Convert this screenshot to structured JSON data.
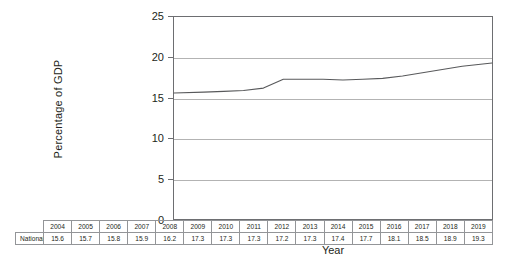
{
  "chart_data": {
    "type": "line",
    "title": "",
    "xlabel": "Year",
    "ylabel": "Percentage of GDP",
    "ylim": [
      0,
      25
    ],
    "yticks": [
      0,
      5,
      10,
      15,
      20,
      25
    ],
    "grid": "horizontal",
    "legend": "none",
    "x": [
      2004,
      2005,
      2006,
      2007,
      2008,
      2009,
      2010,
      2011,
      2012,
      2013,
      2014,
      2015,
      2016,
      2017,
      2018,
      2019
    ],
    "series": [
      {
        "name": "National Health Expenditure as a Percentage of GDP",
        "values": [
          15.6,
          15.7,
          15.8,
          15.9,
          16.2,
          17.3,
          17.3,
          17.3,
          17.2,
          17.3,
          17.4,
          17.7,
          18.1,
          18.5,
          18.9,
          19.3
        ]
      }
    ],
    "line_color": "#58595b",
    "axis_color": "#6d6e71",
    "grid_color": "#b3b3b3"
  },
  "table": {
    "row_label": "National Health Expenditure as a Percentage of GDP",
    "years": [
      "2004",
      "2005",
      "2006",
      "2007",
      "2008",
      "2009",
      "2010",
      "2011",
      "2012",
      "2013",
      "2014",
      "2015",
      "2016",
      "2017",
      "2018",
      "2019"
    ],
    "values": [
      "15.6",
      "15.7",
      "15.8",
      "15.9",
      "16.2",
      "17.3",
      "17.3",
      "17.3",
      "17.2",
      "17.3",
      "17.4",
      "17.7",
      "18.1",
      "18.5",
      "18.9",
      "19.3"
    ]
  },
  "axes": {
    "y_title": "Percentage of GDP",
    "x_title": "Year",
    "y_tick_labels": [
      "25",
      "20",
      "15",
      "10",
      "5",
      "0"
    ]
  }
}
